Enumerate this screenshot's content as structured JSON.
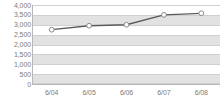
{
  "chart_data": {
    "type": "line",
    "title": "",
    "subtitle": "",
    "xlabel": "",
    "ylabel": "",
    "categories": [
      "6/04",
      "6/05",
      "6/06",
      "6/07",
      "6/08"
    ],
    "values": [
      2750,
      2950,
      3000,
      3500,
      3580
    ],
    "series": [
      {
        "name": "",
        "values": [
          2750,
          2950,
          3000,
          3500,
          3580
        ]
      }
    ],
    "ylim": [
      0,
      4000
    ],
    "ytick_values": [
      0,
      500,
      1000,
      1500,
      2000,
      2500,
      3000,
      3500,
      4000
    ],
    "ytick_labels": [
      "0",
      "500",
      "1,000",
      "1,500",
      "2,000",
      "2,500",
      "3,000",
      "3,500",
      "4,000"
    ],
    "xtick_labels": [
      "6/04",
      "6/05",
      "6/06",
      "6/07",
      "6/08"
    ],
    "grid": true,
    "grid_bands": true,
    "legend": false,
    "legend_position": "none",
    "marker": "circle",
    "colors": {
      "line": "#5a5a5a",
      "marker_fill": "#ffffff",
      "marker_stroke": "#8a8a8a",
      "band": "#e2e2e2",
      "gridline": "#d0d0d0",
      "axis": "#b8b8b8",
      "tick_label": "#7b7b7b",
      "plot_background": "#ffffff"
    }
  }
}
